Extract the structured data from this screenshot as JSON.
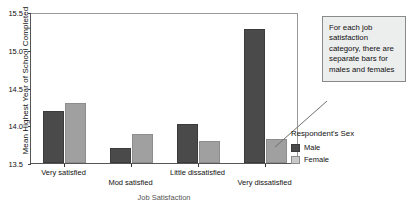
{
  "chart_data": {
    "type": "bar",
    "title": "",
    "xlabel": "Job Satisfaction",
    "ylabel": "Mean Highest Year of School Completed",
    "categories": [
      "Very satisfied",
      "Mod satisfied",
      "Little dissatisfied",
      "Very dissatisfied"
    ],
    "series": [
      {
        "name": "Male",
        "values": [
          14.19,
          13.7,
          14.02,
          15.27
        ],
        "color": "#4a4a4a"
      },
      {
        "name": "Female",
        "values": [
          14.3,
          13.89,
          13.79,
          13.82
        ],
        "color": "#a0a0a0"
      }
    ],
    "ylim": [
      13.5,
      15.5
    ],
    "yticks": [
      "13.5",
      "14.0",
      "14.5",
      "15.0",
      "15.5"
    ],
    "grid": false,
    "legend_position": "right"
  },
  "legend": {
    "title": "Respondent's Sex",
    "entries": [
      {
        "label": "Male"
      },
      {
        "label": "Female"
      }
    ]
  },
  "callout": {
    "text": "For each job satisfaction category, there are separate bars for males and females"
  }
}
